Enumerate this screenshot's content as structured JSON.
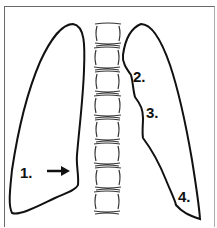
{
  "diagram": {
    "labels": [
      {
        "id": "1",
        "text": "1."
      },
      {
        "id": "2",
        "text": "2."
      },
      {
        "id": "3",
        "text": "3."
      },
      {
        "id": "4",
        "text": "4."
      }
    ],
    "arrow": "right-arrow",
    "vertebrae_count": 8,
    "colors": {
      "line": "#111111",
      "background": "#ffffff",
      "frame": "#6a6a6a"
    }
  }
}
